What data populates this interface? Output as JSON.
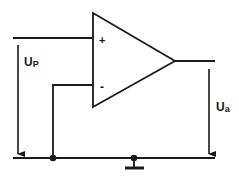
{
  "diagram": {
    "type": "op-amp circuit",
    "opamp": {
      "non_inverting_label": "+",
      "inverting_label": "-"
    },
    "labels": {
      "input_voltage_main": "U",
      "input_voltage_sub": "P",
      "output_voltage_main": "U",
      "output_voltage_sub": "a"
    },
    "colors": {
      "stroke": "#1a1a1a",
      "background": "#ffffff"
    }
  }
}
